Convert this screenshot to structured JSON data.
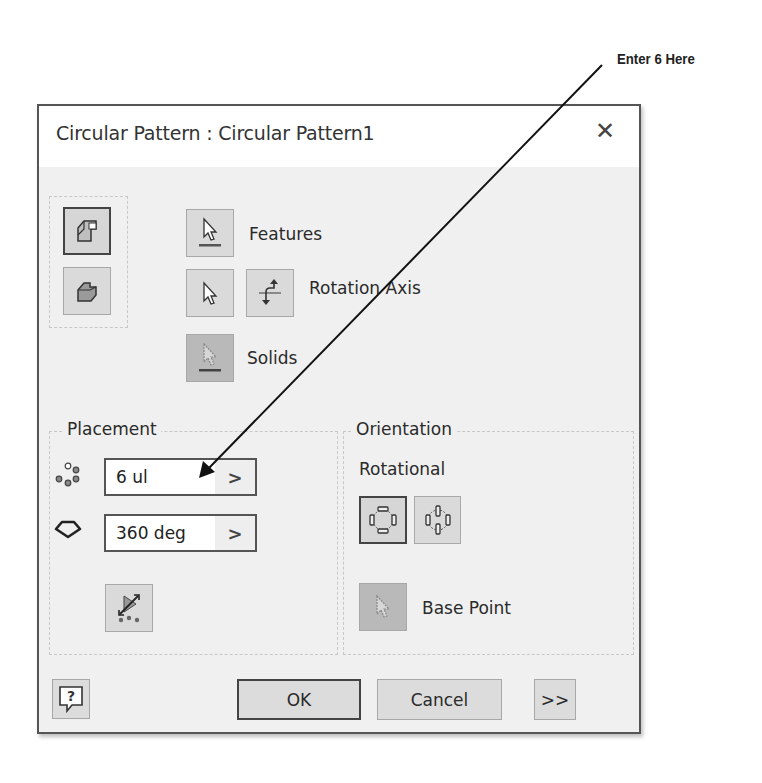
{
  "annotation": {
    "text": "Enter 6 Here",
    "line_from": [
      602,
      65
    ],
    "line_to": [
      199,
      478
    ]
  },
  "dialog": {
    "title": "Circular Pattern : Circular Pattern1",
    "close_icon": "close-icon",
    "selection": {
      "features_label": "Features",
      "rotation_axis_label": "Rotation Axis",
      "solids_label": "Solids"
    },
    "placement": {
      "title": "Placement",
      "count_value": "6 ul",
      "angle_value": "360 deg",
      "arrow": ">"
    },
    "orientation": {
      "title": "Orientation",
      "subtitle": "Rotational",
      "base_point_label": "Base Point"
    },
    "footer": {
      "help": "?",
      "ok": "OK",
      "cancel": "Cancel",
      "more": ">>"
    }
  }
}
